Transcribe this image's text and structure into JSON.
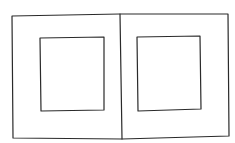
{
  "diagram": {
    "stroke_color": "#2a2a2a",
    "background": "#ffffff",
    "panels": [
      {
        "name": "left-panel",
        "outer": [
          12,
          15,
          109,
          124
        ],
        "inner": [
          40,
          38,
          64,
          73
        ]
      },
      {
        "name": "right-panel",
        "outer": [
          121,
          14,
          108,
          125
        ],
        "inner": [
          137,
          37,
          64,
          74
        ]
      }
    ]
  }
}
